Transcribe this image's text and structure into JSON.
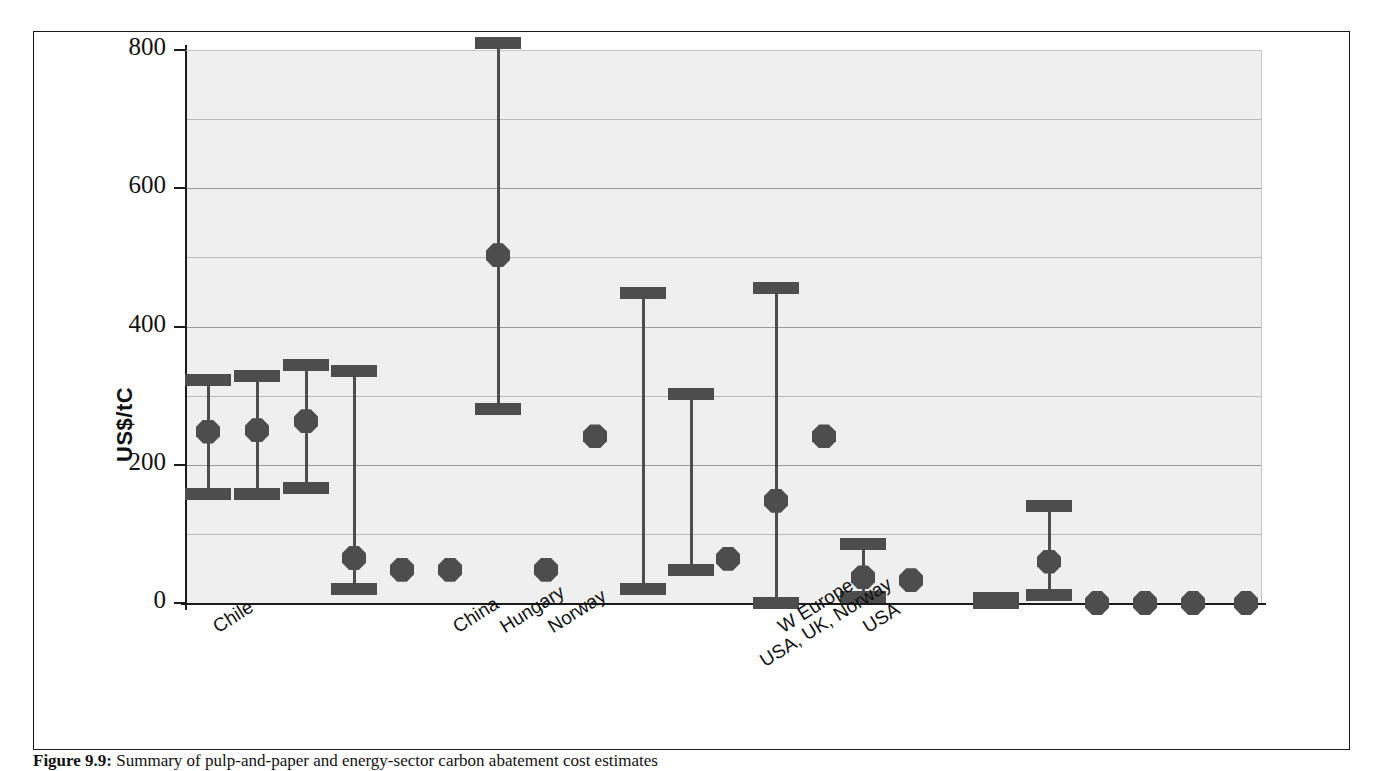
{
  "figure": {
    "caption_label": "Figure 9.9:",
    "caption_text": " Summary of pulp-and-paper and energy-sector carbon abatement cost estimates",
    "y_axis_label": "US$/tC"
  },
  "chart_data": {
    "type": "bar",
    "title": "",
    "xlabel": "",
    "ylabel": "US$/tC",
    "ylim": [
      0,
      800
    ],
    "yticks": [
      0,
      200,
      400,
      600,
      800
    ],
    "ytick_labels": [
      "0",
      "200",
      "400",
      "600",
      "800"
    ],
    "minor_gridlines": [
      100,
      300,
      500,
      700
    ],
    "grid": true,
    "legend": "none",
    "plot_background": "#efefef",
    "mark_color": "#4d4d4d",
    "note": "Each column is one study estimate: central value (diamond/dot marker) with low-high range shown as a capped vertical bar. Some columns show only a range (no central value) or only a point estimate.",
    "categories": [
      "Chile",
      "",
      "",
      "",
      "",
      "China",
      "Hungary",
      "Norway",
      "",
      "",
      "",
      "",
      "W Europe",
      "USA, UK, Norway",
      "USA",
      "",
      "",
      "",
      "",
      "",
      "",
      "",
      ""
    ],
    "visible_x_tick_labels": [
      {
        "label": "Chile",
        "column_index": 0
      },
      {
        "label": "China",
        "column_index": 5
      },
      {
        "label": "Hungary",
        "column_index": 6
      },
      {
        "label": "Norway",
        "column_index": 7
      },
      {
        "label": "W Europe",
        "column_index": 12
      },
      {
        "label": "USA, UK, Norway",
        "column_index": 13
      },
      {
        "label": "USA",
        "column_index": 14
      }
    ],
    "columns": [
      {
        "x": 207,
        "label": "Chile",
        "central": 248,
        "low": 157,
        "high": 322
      },
      {
        "x": 256,
        "label": "",
        "central": 250,
        "low": 158,
        "high": 328
      },
      {
        "x": 305,
        "label": "",
        "central": 263,
        "low": 166,
        "high": 345
      },
      {
        "x": 353,
        "label": "",
        "central": 65,
        "low": 20,
        "high": 335
      },
      {
        "x": 401,
        "label": "",
        "central": 48,
        "low": null,
        "high": null
      },
      {
        "x": 449,
        "label": "China",
        "central": 48,
        "low": null,
        "high": null
      },
      {
        "x": 497,
        "label": "Hungary",
        "central": 503,
        "low": 281,
        "high": 810
      },
      {
        "x": 545,
        "label": "Norway",
        "central": 48,
        "low": null,
        "high": null
      },
      {
        "x": 594,
        "label": "",
        "central": 241,
        "low": null,
        "high": null
      },
      {
        "x": 642,
        "label": "",
        "central": null,
        "low": 20,
        "high": 448
      },
      {
        "x": 690,
        "label": "",
        "central": null,
        "low": 48,
        "high": 302
      },
      {
        "x": 727,
        "label": "",
        "central": 64,
        "low": null,
        "high": null
      },
      {
        "x": 775,
        "label": "W Europe",
        "central": 148,
        "low": 0,
        "high": 455
      },
      {
        "x": 823,
        "label": "USA, UK, Norway",
        "central": 241,
        "low": null,
        "high": null
      },
      {
        "x": 862,
        "label": "USA",
        "central": 37,
        "low": 8,
        "high": 86
      },
      {
        "x": 910,
        "label": "",
        "central": 33,
        "low": null,
        "high": null
      },
      {
        "x": 995,
        "label": "",
        "central": null,
        "low": 0,
        "high": 7
      },
      {
        "x": 1048,
        "label": "",
        "central": 60,
        "low": 12,
        "high": 140
      },
      {
        "x": 1096,
        "label": "",
        "central": 0,
        "low": null,
        "high": null
      },
      {
        "x": 1144,
        "label": "",
        "central": 0,
        "low": null,
        "high": null
      },
      {
        "x": 1192,
        "label": "",
        "central": 0,
        "low": null,
        "high": null
      },
      {
        "x": 1245,
        "label": "",
        "central": 0,
        "low": null,
        "high": null
      }
    ]
  },
  "axis": {
    "y_px_zero": 602,
    "y_px_max": 49,
    "plot_left": 185,
    "plot_right": 1260
  }
}
